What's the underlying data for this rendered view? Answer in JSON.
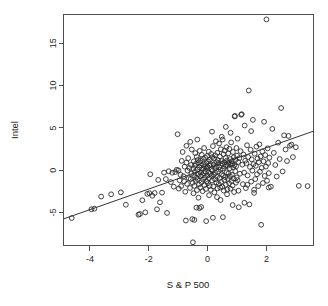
{
  "chart_data": {
    "type": "scatter",
    "title": "",
    "xlabel": "S & P 500",
    "ylabel": "Intel",
    "xlim": [
      -4.9,
      3.6
    ],
    "ylim": [
      -8.9,
      18.4
    ],
    "xticks": [
      -4,
      -2,
      0,
      2
    ],
    "xticklabels": [
      "-4",
      "-2",
      "0",
      "2"
    ],
    "yticks": [
      -5,
      0,
      5,
      10,
      15
    ],
    "yticklabels": [
      "-5",
      "0",
      "5",
      "10",
      "15"
    ],
    "grid": false,
    "legend": null,
    "marker": "open-circle",
    "marker_size": 2.4,
    "trendline": {
      "type": "linear-fit",
      "slope": 1.22,
      "intercept": 0.22,
      "x_start": -4.9,
      "y_start": -5.76,
      "x_end": 3.6,
      "y_end": 4.61
    },
    "n_points": 300,
    "points": [
      [
        -4.62,
        -5.66
      ],
      [
        -3.95,
        -4.62
      ],
      [
        -3.85,
        -4.55
      ],
      [
        -3.62,
        -3.12
      ],
      [
        -3.28,
        -2.85
      ],
      [
        -2.95,
        -2.62
      ],
      [
        -2.35,
        -5.25
      ],
      [
        -2.3,
        -5.18
      ],
      [
        -2.22,
        -3.55
      ],
      [
        -2.12,
        -4.98
      ],
      [
        -2.05,
        -2.8
      ],
      [
        -1.98,
        -2.72
      ],
      [
        -1.95,
        -0.48
      ],
      [
        -1.88,
        -3.02
      ],
      [
        -1.8,
        -2.7
      ],
      [
        -1.72,
        -4.62
      ],
      [
        -1.62,
        -3.8
      ],
      [
        -1.55,
        -2.65
      ],
      [
        -1.48,
        -0.28
      ],
      [
        -1.42,
        -1.05
      ],
      [
        -1.38,
        -5.05
      ],
      [
        -1.32,
        -0.12
      ],
      [
        -1.25,
        -1.4
      ],
      [
        -1.2,
        -0.3
      ],
      [
        -1.15,
        -1.95
      ],
      [
        -1.1,
        -0.22
      ],
      [
        -1.05,
        0.05
      ],
      [
        -1.02,
        4.25
      ],
      [
        -0.98,
        -2.18
      ],
      [
        -0.95,
        -1.2
      ],
      [
        -0.92,
        -0.55
      ],
      [
        -0.9,
        -1.88
      ],
      [
        -0.88,
        1.1
      ],
      [
        -0.85,
        2.15
      ],
      [
        -0.82,
        -0.72
      ],
      [
        -0.8,
        -1.32
      ],
      [
        -0.78,
        0.42
      ],
      [
        -0.76,
        -2.55
      ],
      [
        -0.74,
        -5.95
      ],
      [
        -0.72,
        0.88
      ],
      [
        -0.7,
        -1.62
      ],
      [
        -0.68,
        -0.05
      ],
      [
        -0.66,
        1.42
      ],
      [
        -0.64,
        -0.95
      ],
      [
        -0.62,
        0.25
      ],
      [
        -0.6,
        -2.1
      ],
      [
        -0.58,
        -1.05
      ],
      [
        -0.56,
        0.62
      ],
      [
        -0.55,
        -0.42
      ],
      [
        -0.54,
        2.45
      ],
      [
        -0.52,
        -5.78
      ],
      [
        -0.51,
        -1.48
      ],
      [
        -0.5,
        -8.52
      ],
      [
        -0.49,
        0.18
      ],
      [
        -0.48,
        -2.72
      ],
      [
        -0.47,
        1.05
      ],
      [
        -0.46,
        -0.62
      ],
      [
        -0.45,
        -1.85
      ],
      [
        -0.44,
        0.52
      ],
      [
        -0.43,
        -0.18
      ],
      [
        -0.42,
        2.02
      ],
      [
        -0.41,
        -1.25
      ],
      [
        -0.4,
        0.75
      ],
      [
        -0.39,
        -0.88
      ],
      [
        -0.38,
        -4.42
      ],
      [
        -0.37,
        1.58
      ],
      [
        -0.36,
        -2.35
      ],
      [
        -0.35,
        0.08
      ],
      [
        -0.34,
        -1.05
      ],
      [
        -0.33,
        1.22
      ],
      [
        -0.32,
        -0.45
      ],
      [
        -0.31,
        -3.25
      ],
      [
        -0.3,
        0.92
      ],
      [
        -0.29,
        -1.68
      ],
      [
        -0.28,
        0.32
      ],
      [
        -0.27,
        2.28
      ],
      [
        -0.26,
        -0.72
      ],
      [
        -0.25,
        -2.05
      ],
      [
        -0.24,
        1.12
      ],
      [
        -0.23,
        -0.25
      ],
      [
        -0.22,
        0.55
      ],
      [
        -0.21,
        -1.42
      ],
      [
        -0.2,
        1.82
      ],
      [
        -0.19,
        -0.58
      ],
      [
        -0.18,
        0.15
      ],
      [
        -0.17,
        -2.48
      ],
      [
        -0.16,
        1.35
      ],
      [
        -0.15,
        -1.12
      ],
      [
        -0.14,
        0.68
      ],
      [
        -0.13,
        -0.35
      ],
      [
        -0.12,
        2.62
      ],
      [
        -0.11,
        -1.75
      ],
      [
        -0.1,
        0.45
      ],
      [
        -0.09,
        -0.88
      ],
      [
        -0.08,
        1.48
      ],
      [
        -0.07,
        -0.15
      ],
      [
        -0.06,
        -2.22
      ],
      [
        -0.05,
        0.82
      ],
      [
        -0.04,
        -1.32
      ],
      [
        -0.03,
        0.22
      ],
      [
        -0.02,
        1.68
      ],
      [
        -0.01,
        -0.62
      ],
      [
        0.0,
        0.38
      ],
      [
        0.01,
        -1.55
      ],
      [
        0.02,
        1.02
      ],
      [
        0.03,
        -0.28
      ],
      [
        0.04,
        2.18
      ],
      [
        0.05,
        -0.95
      ],
      [
        0.06,
        0.58
      ],
      [
        0.07,
        -1.85
      ],
      [
        0.08,
        1.25
      ],
      [
        0.09,
        -0.42
      ],
      [
        0.1,
        0.72
      ],
      [
        0.11,
        -2.32
      ],
      [
        0.12,
        1.92
      ],
      [
        0.13,
        -0.68
      ],
      [
        0.14,
        0.12
      ],
      [
        0.15,
        -1.22
      ],
      [
        0.16,
        1.55
      ],
      [
        0.17,
        -0.05
      ],
      [
        0.18,
        2.85
      ],
      [
        0.19,
        -1.92
      ],
      [
        0.2,
        0.65
      ],
      [
        0.21,
        -0.52
      ],
      [
        0.22,
        1.38
      ],
      [
        0.23,
        -2.62
      ],
      [
        0.24,
        0.28
      ],
      [
        0.25,
        -1.08
      ],
      [
        0.26,
        1.75
      ],
      [
        0.27,
        -0.32
      ],
      [
        0.28,
        3.42
      ],
      [
        0.29,
        0.95
      ],
      [
        0.3,
        -1.45
      ],
      [
        0.31,
        0.48
      ],
      [
        0.32,
        -0.78
      ],
      [
        0.33,
        2.05
      ],
      [
        0.34,
        -2.15
      ],
      [
        0.35,
        1.18
      ],
      [
        0.36,
        -0.18
      ],
      [
        0.37,
        0.85
      ],
      [
        0.38,
        -1.62
      ],
      [
        0.39,
        3.15
      ],
      [
        0.4,
        0.35
      ],
      [
        0.41,
        -0.92
      ],
      [
        0.42,
        1.62
      ],
      [
        0.43,
        -2.05
      ],
      [
        0.44,
        0.05
      ],
      [
        0.45,
        2.48
      ],
      [
        0.46,
        -1.38
      ],
      [
        0.47,
        1.08
      ],
      [
        0.48,
        -0.48
      ],
      [
        0.49,
        0.78
      ],
      [
        0.5,
        -1.95
      ],
      [
        0.51,
        3.62
      ],
      [
        0.52,
        0.18
      ],
      [
        0.53,
        -0.65
      ],
      [
        0.54,
        1.88
      ],
      [
        0.55,
        -2.42
      ],
      [
        0.56,
        0.92
      ],
      [
        0.57,
        -1.15
      ],
      [
        0.58,
        2.32
      ],
      [
        0.59,
        0.42
      ],
      [
        0.6,
        -0.82
      ],
      [
        0.61,
        1.45
      ],
      [
        0.62,
        -1.72
      ],
      [
        0.63,
        0.62
      ],
      [
        0.64,
        2.72
      ],
      [
        0.65,
        -0.25
      ],
      [
        0.66,
        1.15
      ],
      [
        0.67,
        -2.28
      ],
      [
        0.68,
        0.52
      ],
      [
        0.69,
        -1.02
      ],
      [
        0.7,
        1.98
      ],
      [
        0.71,
        -0.38
      ],
      [
        0.72,
        0.88
      ],
      [
        0.73,
        -1.55
      ],
      [
        0.74,
        2.52
      ],
      [
        0.75,
        0.22
      ],
      [
        0.76,
        -0.72
      ],
      [
        0.77,
        1.32
      ],
      [
        0.78,
        -2.18
      ],
      [
        0.79,
        0.68
      ],
      [
        0.8,
        3.28
      ],
      [
        0.81,
        -1.28
      ],
      [
        0.82,
        1.05
      ],
      [
        0.83,
        -0.55
      ],
      [
        0.84,
        0.75
      ],
      [
        0.85,
        -1.82
      ],
      [
        0.86,
        2.15
      ],
      [
        0.87,
        0.32
      ],
      [
        0.88,
        -0.98
      ],
      [
        0.89,
        1.52
      ],
      [
        0.9,
        -2.58
      ],
      [
        0.91,
        0.58
      ],
      [
        0.92,
        6.35
      ],
      [
        0.93,
        6.42
      ],
      [
        0.94,
        -0.12
      ],
      [
        0.95,
        1.22
      ],
      [
        0.96,
        -1.48
      ],
      [
        0.97,
        0.45
      ],
      [
        0.98,
        2.62
      ],
      [
        0.99,
        -0.85
      ],
      [
        1.0,
        1.72
      ],
      [
        1.02,
        -1.18
      ],
      [
        1.04,
        0.98
      ],
      [
        1.06,
        -4.38
      ],
      [
        1.08,
        1.42
      ],
      [
        1.1,
        -0.42
      ],
      [
        1.12,
        2.25
      ],
      [
        1.14,
        6.55
      ],
      [
        1.16,
        6.62
      ],
      [
        1.18,
        0.65
      ],
      [
        1.2,
        -1.65
      ],
      [
        1.22,
        1.85
      ],
      [
        1.24,
        -0.28
      ],
      [
        1.26,
        5.28
      ],
      [
        1.28,
        1.12
      ],
      [
        1.3,
        -2.12
      ],
      [
        1.32,
        0.82
      ],
      [
        1.34,
        2.95
      ],
      [
        1.36,
        -0.62
      ],
      [
        1.38,
        1.55
      ],
      [
        1.4,
        9.42
      ],
      [
        1.42,
        -4.05
      ],
      [
        1.44,
        0.38
      ],
      [
        1.46,
        2.42
      ],
      [
        1.48,
        -1.35
      ],
      [
        1.5,
        1.28
      ],
      [
        1.52,
        -0.05
      ],
      [
        1.54,
        5.95
      ],
      [
        1.56,
        0.72
      ],
      [
        1.58,
        -2.68
      ],
      [
        1.6,
        1.95
      ],
      [
        1.62,
        -1.05
      ],
      [
        1.64,
        0.52
      ],
      [
        1.66,
        2.78
      ],
      [
        1.68,
        -0.48
      ],
      [
        1.7,
        1.38
      ],
      [
        1.72,
        -1.88
      ],
      [
        1.74,
        0.95
      ],
      [
        1.76,
        3.05
      ],
      [
        1.78,
        -0.18
      ],
      [
        1.8,
        1.62
      ],
      [
        1.82,
        -6.45
      ],
      [
        1.84,
        0.28
      ],
      [
        1.86,
        2.22
      ],
      [
        1.88,
        -1.52
      ],
      [
        1.9,
        1.05
      ],
      [
        1.92,
        5.72
      ],
      [
        1.94,
        -0.68
      ],
      [
        1.96,
        1.78
      ],
      [
        1.98,
        0.42
      ],
      [
        2.0,
        17.82
      ],
      [
        2.02,
        -1.25
      ],
      [
        2.04,
        2.58
      ],
      [
        2.06,
        0.85
      ],
      [
        2.08,
        -0.35
      ],
      [
        2.1,
        1.48
      ],
      [
        2.15,
        -1.95
      ],
      [
        2.2,
        4.88
      ],
      [
        2.25,
        2.05
      ],
      [
        2.3,
        0.62
      ],
      [
        2.35,
        -0.75
      ],
      [
        2.4,
        3.25
      ],
      [
        2.45,
        1.32
      ],
      [
        2.5,
        7.35
      ],
      [
        2.55,
        -0.15
      ],
      [
        2.6,
        4.12
      ],
      [
        2.65,
        2.45
      ],
      [
        2.7,
        1.08
      ],
      [
        2.75,
        4.05
      ],
      [
        2.8,
        2.88
      ],
      [
        2.85,
        3.02
      ],
      [
        2.9,
        1.55
      ],
      [
        3.0,
        2.72
      ],
      [
        3.1,
        -1.85
      ],
      [
        3.4,
        -1.88
      ],
      [
        -2.78,
        -4.08
      ],
      [
        -1.68,
        -1.15
      ],
      [
        -0.99,
        -0.02
      ],
      [
        -0.59,
        3.35
      ],
      [
        0.44,
        -3.52
      ],
      [
        0.66,
        -2.85
      ],
      [
        1.05,
        -2.42
      ],
      [
        1.35,
        -1.72
      ],
      [
        -0.28,
        -4.48
      ],
      [
        -0.22,
        -4.35
      ],
      [
        0.05,
        -2.95
      ],
      [
        0.32,
        -3.18
      ],
      [
        -0.45,
        -5.88
      ],
      [
        0.18,
        -5.62
      ],
      [
        0.52,
        -5.55
      ],
      [
        -0.05,
        -6.02
      ],
      [
        0.85,
        -4.12
      ],
      [
        1.25,
        -3.85
      ],
      [
        1.58,
        -2.32
      ],
      [
        2.08,
        -2.05
      ],
      [
        0.15,
        4.55
      ],
      [
        0.48,
        3.95
      ],
      [
        0.78,
        4.42
      ],
      [
        1.02,
        3.72
      ],
      [
        -0.72,
        2.88
      ],
      [
        -0.35,
        3.62
      ],
      [
        0.62,
        5.12
      ],
      [
        1.48,
        4.62
      ]
    ]
  },
  "figure": {
    "background": "#ffffff",
    "foreground": "#2b2b2b",
    "axis_color": "#4d4d4d",
    "point_color": "#2b2b2b",
    "line_color": "#333333"
  }
}
